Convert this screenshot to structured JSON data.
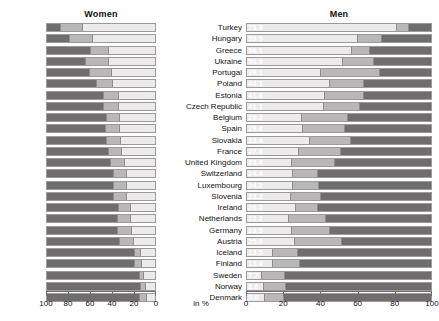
{
  "panels": {
    "left_title": "Women",
    "right_title": "Men"
  },
  "unit_label": "in %",
  "chart_data": {
    "type": "bar",
    "subtype": "diverging-stacked-bar",
    "title": "",
    "xlabel": "in %",
    "ylabel": "",
    "xlim": [
      0,
      100
    ],
    "grid": false,
    "legend_position": "none",
    "left_axis_direction": "reversed",
    "left_ticks": [
      100,
      80,
      60,
      40,
      20,
      0
    ],
    "right_ticks": [
      0,
      20,
      40,
      60,
      80,
      100
    ],
    "categories": [
      "Turkey",
      "Hungary",
      "Greece",
      "Ukraine",
      "Portugal",
      "Poland",
      "Estonia",
      "Czech Republic",
      "Belgium",
      "Spain",
      "Slovakia",
      "France",
      "United Kingdom",
      "Switzerland",
      "Luxembourg",
      "Slovenia",
      "Ireland",
      "Netherlands",
      "Germany",
      "Austria",
      "Iceland",
      "Finland",
      "Sweden",
      "Norway",
      "Denmark"
    ],
    "series": [
      {
        "name": "Women",
        "panel": "left",
        "values": [
          65.3,
          56.0,
          42.0,
          41.7,
          38.7,
          37.9,
          33.1,
          32.4,
          32.2,
          31.5,
          31.1,
          30.0,
          27.1,
          25.7,
          25.4,
          25.2,
          22.0,
          21.8,
          20.9,
          18.7,
          12.4,
          11.4,
          9.8,
          8.1,
          7.7
        ]
      },
      {
        "name": "Men",
        "panel": "right",
        "values": [
          79.9,
          59.0,
          56.1,
          50.9,
          39.1,
          44.1,
          41.3,
          41.1,
          29.2,
          29.4,
          33.4,
          27.3,
          23.4,
          24.4,
          24.2,
          23.2,
          26.0,
          22.2,
          23.5,
          25.0,
          13.5,
          13.4,
          7.7,
          8.6,
          9.0
        ]
      }
    ],
    "stack_segments": {
      "women": [
        [
          65.3,
          20.2,
          14.5
        ],
        [
          56.0,
          21.0,
          23.0
        ],
        [
          42.0,
          16.5,
          41.5
        ],
        [
          41.7,
          21.0,
          37.3
        ],
        [
          38.7,
          20.0,
          41.3
        ],
        [
          37.9,
          14.5,
          47.6
        ],
        [
          33.1,
          13.0,
          53.9
        ],
        [
          32.4,
          14.0,
          53.6
        ],
        [
          32.2,
          11.0,
          56.8
        ],
        [
          31.5,
          13.5,
          55.0
        ],
        [
          31.1,
          12.5,
          56.4
        ],
        [
          30.0,
          12.0,
          58.0
        ],
        [
          27.1,
          12.5,
          60.4
        ],
        [
          25.7,
          12.0,
          62.3
        ],
        [
          25.4,
          11.5,
          63.1
        ],
        [
          25.2,
          12.0,
          62.8
        ],
        [
          22.0,
          11.0,
          67.0
        ],
        [
          21.8,
          12.0,
          66.2
        ],
        [
          20.9,
          12.5,
          66.6
        ],
        [
          18.7,
          13.5,
          67.8
        ],
        [
          12.4,
          5.5,
          82.1
        ],
        [
          11.4,
          6.5,
          82.1
        ],
        [
          9.8,
          3.5,
          86.7
        ],
        [
          8.1,
          4.5,
          87.4
        ],
        [
          7.7,
          5.5,
          86.8
        ]
      ],
      "men": [
        [
          79.9,
          6.5,
          13.6
        ],
        [
          59.0,
          13.0,
          28.0
        ],
        [
          56.1,
          9.5,
          34.4
        ],
        [
          50.9,
          17.0,
          32.1
        ],
        [
          39.1,
          32.0,
          28.9
        ],
        [
          44.1,
          18.5,
          37.4
        ],
        [
          41.3,
          21.0,
          37.7
        ],
        [
          41.1,
          19.0,
          39.9
        ],
        [
          29.2,
          24.5,
          46.3
        ],
        [
          29.4,
          23.0,
          47.6
        ],
        [
          33.4,
          22.0,
          44.6
        ],
        [
          27.3,
          22.5,
          50.2
        ],
        [
          23.4,
          23.5,
          53.1
        ],
        [
          24.4,
          13.5,
          62.1
        ],
        [
          24.2,
          14.0,
          61.8
        ],
        [
          23.2,
          16.0,
          60.8
        ],
        [
          26.0,
          11.5,
          62.5
        ],
        [
          22.2,
          20.0,
          57.8
        ],
        [
          23.5,
          20.5,
          56.0
        ],
        [
          25.0,
          25.5,
          49.5
        ],
        [
          13.5,
          13.5,
          73.0
        ],
        [
          13.4,
          14.5,
          72.1
        ],
        [
          7.7,
          12.0,
          80.3
        ],
        [
          8.6,
          12.0,
          79.4
        ],
        [
          9.0,
          10.5,
          80.5
        ]
      ]
    },
    "colors": {
      "segment_1": "#eceaea",
      "segment_2": "#b9b7b7",
      "segment_3": "#6f6d6d",
      "bar_border": "#9a9a9a",
      "axis": "#6f6d6d",
      "label_text": "#ffffff",
      "text": "#111111"
    }
  }
}
